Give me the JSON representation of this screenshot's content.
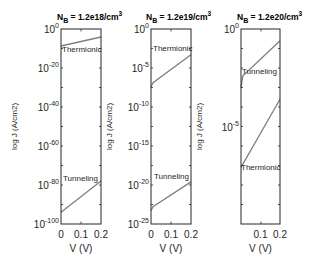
{
  "chart_data": [
    {
      "type": "line",
      "title": "N_B = 1.2e18/cm^3",
      "title_main": "N",
      "title_sub": "B",
      "title_rest": " = 1.2e18/cm",
      "title_sup": "3",
      "xlabel": "V (V)",
      "ylabel": "log J (A/cm2)",
      "yscale": "log",
      "xlim": [
        0,
        0.2
      ],
      "ylim": [
        1e-100,
        1
      ],
      "xticks": [
        "0",
        "0.1",
        "0.2"
      ],
      "yticks": [
        {
          "base": "10",
          "exp": "0"
        },
        {
          "base": "10",
          "exp": "-20"
        },
        {
          "base": "10",
          "exp": "-40"
        },
        {
          "base": "10",
          "exp": "-60"
        },
        {
          "base": "10",
          "exp": "-80"
        },
        {
          "base": "10",
          "exp": "-100"
        }
      ],
      "series": [
        {
          "name": "Thermionic",
          "x": [
            0,
            0.2
          ],
          "log10_y": [
            -8.7,
            -4.1
          ]
        },
        {
          "name": "Tunneling",
          "x": [
            0,
            0.2
          ],
          "log10_y": [
            -94,
            -78
          ]
        }
      ],
      "grid": false
    },
    {
      "type": "line",
      "title": "N_B = 1.2e19/cm^3",
      "title_main": "N",
      "title_sub": "B",
      "title_rest": " = 1.2e19/cm",
      "title_sup": "3",
      "xlabel": "V (V)",
      "ylabel": "log J (A/cm2)",
      "yscale": "log",
      "xlim": [
        0,
        0.2
      ],
      "ylim": [
        1e-25,
        1
      ],
      "xticks": [
        "0",
        "0.1",
        "0.2"
      ],
      "yticks": [
        {
          "base": "10",
          "exp": "0"
        },
        {
          "base": "10",
          "exp": "-5"
        },
        {
          "base": "10",
          "exp": "-10"
        },
        {
          "base": "10",
          "exp": "-15"
        },
        {
          "base": "10",
          "exp": "-20"
        },
        {
          "base": "10",
          "exp": "-25"
        }
      ],
      "series": [
        {
          "name": "Thermionic",
          "x": [
            0,
            0.01,
            0.2
          ],
          "log10_y": [
            -7.4,
            -6.9,
            -3.3
          ]
        },
        {
          "name": "Tunneling",
          "x": [
            0,
            0.01,
            0.2
          ],
          "log10_y": [
            -23.3,
            -22.8,
            -19.6
          ]
        }
      ],
      "grid": false
    },
    {
      "type": "line",
      "title": "N_B = 1.2e20/cm^3",
      "title_main": "N",
      "title_sub": "B",
      "title_rest": " = 1.2e20/cm",
      "title_sup": "3",
      "xlabel": "V (V)",
      "ylabel": "log J (A/cm2)",
      "yscale": "log",
      "xlim": [
        0,
        0.2
      ],
      "ylim": [
        1e-10,
        1
      ],
      "xticks": [
        "0.1",
        "0.2"
      ],
      "yticks": [
        {
          "base": "10",
          "exp": "0"
        },
        {
          "base": "10",
          "exp": "-5"
        }
      ],
      "series": [
        {
          "name": "Tunneling",
          "x": [
            0,
            0.01,
            0.2
          ],
          "log10_y": [
            -3.0,
            -2.4,
            -0.6
          ]
        },
        {
          "name": "Thermionic",
          "x": [
            0,
            0.2
          ],
          "log10_y": [
            -7.1,
            -3.6
          ]
        }
      ],
      "grid": false
    }
  ],
  "colors": {
    "line": "#7f7f7f",
    "axis": "#262626"
  }
}
